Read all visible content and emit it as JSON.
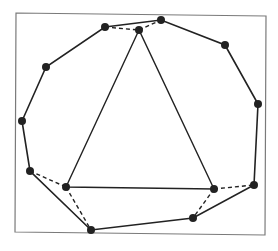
{
  "figure": {
    "width": 278,
    "height": 251,
    "colors": {
      "background": "#ffffff",
      "frame": "#7a7a7a",
      "edge": "#222222",
      "point": "#222222"
    },
    "frame": {
      "points": [
        [
          16,
          13
        ],
        [
          266,
          16
        ],
        [
          265,
          235
        ],
        [
          15,
          232
        ]
      ]
    },
    "outer_polygon": {
      "points": [
        [
          105,
          27
        ],
        [
          161,
          20
        ],
        [
          225,
          45
        ],
        [
          258,
          104
        ],
        [
          254,
          185
        ],
        [
          193,
          218
        ],
        [
          91,
          230
        ],
        [
          30,
          171
        ],
        [
          22,
          121
        ],
        [
          46,
          67
        ]
      ]
    },
    "triangle": {
      "points": [
        [
          139,
          30
        ],
        [
          66,
          187
        ],
        [
          214,
          189
        ]
      ]
    },
    "dashed_edges": [
      [
        [
          105,
          27
        ],
        [
          139,
          30
        ]
      ],
      [
        [
          139,
          30
        ],
        [
          161,
          20
        ]
      ],
      [
        [
          30,
          171
        ],
        [
          66,
          187
        ]
      ],
      [
        [
          66,
          187
        ],
        [
          91,
          230
        ]
      ],
      [
        [
          214,
          189
        ],
        [
          254,
          185
        ]
      ],
      [
        [
          214,
          189
        ],
        [
          193,
          218
        ]
      ]
    ],
    "point_radius": 4
  }
}
